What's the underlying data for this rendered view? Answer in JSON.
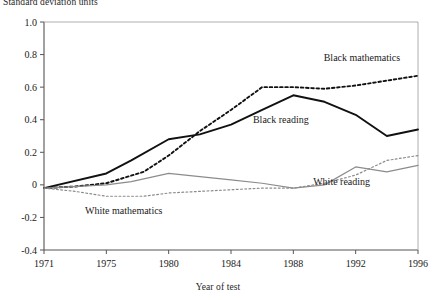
{
  "figure": {
    "ylabel": "Standard deviation units",
    "xlabel": "Year of test"
  },
  "chart_data": {
    "type": "line",
    "title": "",
    "ylabel": "Standard deviation units",
    "xlabel": "Year of test",
    "ylim": [
      -0.4,
      1.0
    ],
    "ytick_labels": [
      "1.0",
      "0.8",
      "0.6",
      "0.4",
      "0.2",
      "0",
      "-0.2",
      "-0.4"
    ],
    "yticks": [
      1.0,
      0.8,
      0.6,
      0.4,
      0.2,
      0,
      -0.2,
      -0.4
    ],
    "xtick_labels": [
      "1971",
      "1975",
      "1980",
      "1984",
      "1988",
      "1992",
      "1996"
    ],
    "xticks": [
      1971,
      1975,
      1980,
      1984,
      1988,
      1992,
      1996
    ],
    "x_scale": "categorical-evenly-spaced",
    "grid": false,
    "legend": "inline-annotations",
    "series": [
      {
        "name": "Black mathematics",
        "style": "dotted",
        "color": "#111111",
        "label_x": 1992.4,
        "label_y": 0.78,
        "x": [
          1971,
          1973,
          1975,
          1978,
          1980,
          1982,
          1984,
          1986,
          1988,
          1990,
          1992,
          1994,
          1996
        ],
        "values": [
          -0.02,
          -0.01,
          0.01,
          0.08,
          0.18,
          0.33,
          0.46,
          0.6,
          0.6,
          0.59,
          0.61,
          0.64,
          0.67
        ]
      },
      {
        "name": "Black reading",
        "style": "solid",
        "color": "#111111",
        "label_x": 1987.2,
        "label_y": 0.4,
        "x": [
          1971,
          1975,
          1977,
          1980,
          1982,
          1984,
          1986,
          1988,
          1990,
          1992,
          1994,
          1996
        ],
        "values": [
          -0.02,
          0.07,
          0.15,
          0.28,
          0.31,
          0.37,
          0.46,
          0.55,
          0.51,
          0.43,
          0.3,
          0.34
        ]
      },
      {
        "name": "White reading",
        "style": "solid",
        "color": "#8c8c8c",
        "label_x": 1991.1,
        "label_y": 0.02,
        "x": [
          1971,
          1975,
          1977,
          1980,
          1982,
          1984,
          1986,
          1988,
          1990,
          1992,
          1994,
          1996
        ],
        "values": [
          -0.02,
          0.0,
          0.02,
          0.07,
          0.05,
          0.03,
          0.01,
          -0.02,
          0.0,
          0.11,
          0.08,
          0.12
        ]
      },
      {
        "name": "White mathematics",
        "style": "dotted",
        "color": "#8c8c8c",
        "label_x": 1976.4,
        "label_y": -0.16,
        "x": [
          1971,
          1973,
          1975,
          1978,
          1980,
          1982,
          1984,
          1986,
          1988,
          1990,
          1992,
          1994,
          1996
        ],
        "values": [
          -0.02,
          -0.04,
          -0.07,
          -0.07,
          -0.05,
          -0.04,
          -0.03,
          -0.02,
          -0.02,
          0.01,
          0.06,
          0.15,
          0.18
        ]
      }
    ]
  }
}
